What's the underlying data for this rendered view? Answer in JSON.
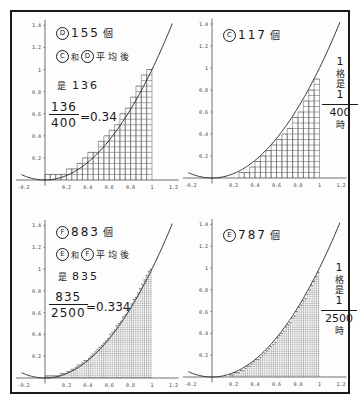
{
  "panels": [
    {
      "id": "top-left",
      "count_label": {
        "circle": "D",
        "value": "155",
        "unit": "個"
      },
      "avg_label": {
        "circle_a": "C",
        "and": "和",
        "circle_b": "D",
        "text": "平均後"
      },
      "result_label": {
        "prefix": "是",
        "value": "136"
      },
      "fraction": {
        "numerator": "136",
        "denominator": "400",
        "equals": "=",
        "result": "0.34"
      }
    },
    {
      "id": "top-right",
      "count_label": {
        "circle": "C",
        "value": "117",
        "unit": "個"
      },
      "side_note": {
        "top": "1",
        "mid1": "格",
        "mid2": "是",
        "numerator": "1",
        "denominator": "400",
        "suffix": "時"
      }
    },
    {
      "id": "bottom-left",
      "count_label": {
        "circle": "F",
        "value": "883",
        "unit": "個"
      },
      "avg_label": {
        "circle_a": "E",
        "and": "和",
        "circle_b": "F",
        "text": "平均後"
      },
      "result_label": {
        "prefix": "是",
        "value": "835"
      },
      "fraction": {
        "numerator": "835",
        "denominator": "2500",
        "equals": "=",
        "result": "0.334"
      }
    },
    {
      "id": "bottom-right",
      "count_label": {
        "circle": "E",
        "value": "787",
        "unit": "個"
      },
      "side_note": {
        "top": "1",
        "mid1": "格",
        "mid2": "是",
        "numerator": "1",
        "denominator": "2500",
        "suffix": "時"
      }
    }
  ],
  "chart_data": [
    {
      "type": "area",
      "title": "y = x^2 on [0,1], 20×20 grid, upper cell count",
      "function": "y = x^2",
      "grid_divisions": 20,
      "cell_area": "1/400",
      "counted_cells": 155,
      "x_ticks": [
        "-0.2",
        "0.2",
        "0.4",
        "0.6",
        "0.8",
        "1",
        "1.2"
      ],
      "y_ticks": [
        "0.2",
        "0.4",
        "0.6",
        "0.8",
        "1",
        "1.2",
        "1.4"
      ],
      "xlim": [
        -0.25,
        1.25
      ],
      "ylim": [
        0,
        1.45
      ],
      "shading": "upper"
    },
    {
      "type": "area",
      "title": "y = x^2 on [0,1], 20×20 grid, lower cell count",
      "function": "y = x^2",
      "grid_divisions": 20,
      "cell_area": "1/400",
      "counted_cells": 117,
      "x_ticks": [
        "-0.2",
        "0.2",
        "0.4",
        "0.6",
        "0.8",
        "1",
        "1.2"
      ],
      "y_ticks": [
        "0.2",
        "0.4",
        "0.6",
        "0.8",
        "1",
        "1.2",
        "1.4"
      ],
      "xlim": [
        -0.25,
        1.25
      ],
      "ylim": [
        0,
        1.45
      ],
      "shading": "lower"
    },
    {
      "type": "area",
      "title": "y = x^2 on [0,1], 50×50 grid, upper cell count",
      "function": "y = x^2",
      "grid_divisions": 50,
      "cell_area": "1/2500",
      "counted_cells": 883,
      "x_ticks": [
        "-0.2",
        "0.2",
        "0.4",
        "0.6",
        "0.8",
        "1",
        "1.2"
      ],
      "y_ticks": [
        "0.2",
        "0.4",
        "0.6",
        "0.8",
        "1",
        "1.2",
        "1.4"
      ],
      "xlim": [
        -0.25,
        1.25
      ],
      "ylim": [
        0,
        1.45
      ],
      "shading": "upper"
    },
    {
      "type": "area",
      "title": "y = x^2 on [0,1], 50×50 grid, lower cell count",
      "function": "y = x^2",
      "grid_divisions": 50,
      "cell_area": "1/2500",
      "counted_cells": 787,
      "x_ticks": [
        "-0.2",
        "0.2",
        "0.4",
        "0.6",
        "0.8",
        "1",
        "1.2"
      ],
      "y_ticks": [
        "0.2",
        "0.4",
        "0.6",
        "0.8",
        "1",
        "1.2",
        "1.4"
      ],
      "xlim": [
        -0.25,
        1.25
      ],
      "ylim": [
        0,
        1.45
      ],
      "shading": "lower"
    }
  ]
}
